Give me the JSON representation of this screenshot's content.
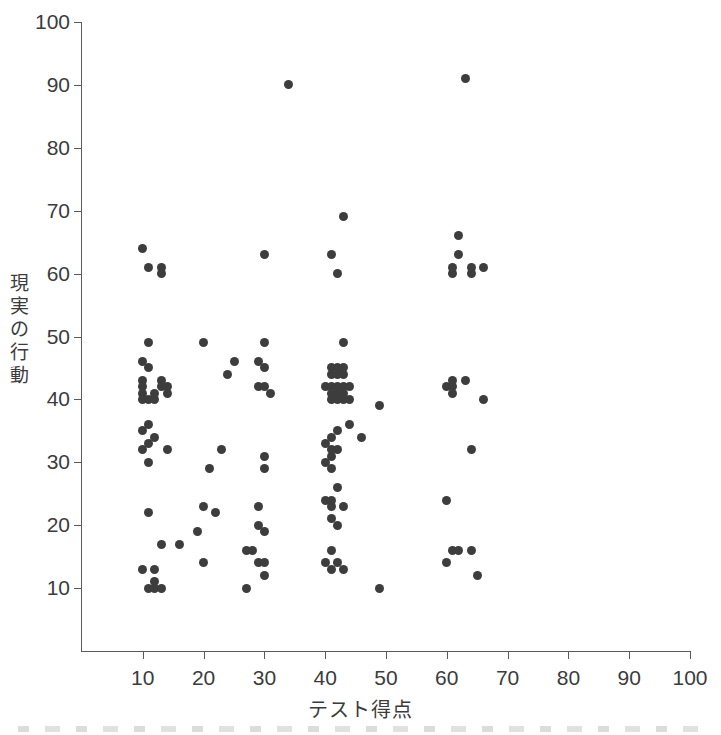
{
  "chart_data": {
    "type": "scatter",
    "title": "",
    "xlabel": "テスト得点",
    "ylabel": "現実の行動",
    "xlim": [
      0,
      100
    ],
    "ylim": [
      0,
      100
    ],
    "xticks": [
      10,
      20,
      30,
      40,
      50,
      60,
      70,
      80,
      90,
      100
    ],
    "yticks": [
      10,
      20,
      30,
      40,
      50,
      60,
      70,
      80,
      90,
      100
    ],
    "grid": false,
    "legend": null,
    "marker": {
      "shape": "circle",
      "color": "#3d3d3d",
      "size": 9
    },
    "points": [
      [
        34,
        90
      ],
      [
        63,
        91
      ],
      [
        43,
        69
      ],
      [
        10,
        64
      ],
      [
        62,
        66
      ],
      [
        11,
        61
      ],
      [
        13,
        61
      ],
      [
        13,
        60
      ],
      [
        30,
        63
      ],
      [
        41,
        63
      ],
      [
        62,
        63
      ],
      [
        42,
        60
      ],
      [
        61,
        60
      ],
      [
        61,
        61
      ],
      [
        64,
        61
      ],
      [
        66,
        61
      ],
      [
        64,
        60
      ],
      [
        11,
        49
      ],
      [
        20,
        49
      ],
      [
        30,
        49
      ],
      [
        43,
        49
      ],
      [
        10,
        46
      ],
      [
        25,
        46
      ],
      [
        29,
        46
      ],
      [
        11,
        45
      ],
      [
        24,
        44
      ],
      [
        30,
        45
      ],
      [
        41,
        45
      ],
      [
        42,
        45
      ],
      [
        43,
        45
      ],
      [
        10,
        43
      ],
      [
        13,
        43
      ],
      [
        41,
        44
      ],
      [
        42,
        44
      ],
      [
        43,
        44
      ],
      [
        61,
        43
      ],
      [
        63,
        43
      ],
      [
        10,
        42
      ],
      [
        13,
        42
      ],
      [
        14,
        42
      ],
      [
        29,
        42
      ],
      [
        30,
        42
      ],
      [
        40,
        42
      ],
      [
        41,
        42
      ],
      [
        42,
        42
      ],
      [
        43,
        42
      ],
      [
        44,
        42
      ],
      [
        60,
        42
      ],
      [
        61,
        42
      ],
      [
        10,
        41
      ],
      [
        12,
        41
      ],
      [
        14,
        41
      ],
      [
        31,
        41
      ],
      [
        41,
        41
      ],
      [
        42,
        41
      ],
      [
        43,
        41
      ],
      [
        61,
        41
      ],
      [
        66,
        40
      ],
      [
        10,
        40
      ],
      [
        11,
        40
      ],
      [
        12,
        40
      ],
      [
        41,
        40
      ],
      [
        42,
        40
      ],
      [
        43,
        40
      ],
      [
        44,
        40
      ],
      [
        49,
        39
      ],
      [
        11,
        36
      ],
      [
        44,
        36
      ],
      [
        10,
        35
      ],
      [
        42,
        35
      ],
      [
        12,
        34
      ],
      [
        41,
        34
      ],
      [
        46,
        34
      ],
      [
        11,
        33
      ],
      [
        40,
        33
      ],
      [
        10,
        32
      ],
      [
        14,
        32
      ],
      [
        23,
        32
      ],
      [
        41,
        32
      ],
      [
        42,
        32
      ],
      [
        64,
        32
      ],
      [
        11,
        30
      ],
      [
        30,
        31
      ],
      [
        41,
        31
      ],
      [
        40,
        30
      ],
      [
        21,
        29
      ],
      [
        30,
        29
      ],
      [
        41,
        29
      ],
      [
        42,
        26
      ],
      [
        40,
        24
      ],
      [
        41,
        24
      ],
      [
        60,
        24
      ],
      [
        11,
        22
      ],
      [
        20,
        23
      ],
      [
        29,
        23
      ],
      [
        41,
        23
      ],
      [
        43,
        23
      ],
      [
        22,
        22
      ],
      [
        41,
        21
      ],
      [
        29,
        20
      ],
      [
        42,
        20
      ],
      [
        19,
        19
      ],
      [
        30,
        19
      ],
      [
        13,
        17
      ],
      [
        16,
        17
      ],
      [
        61,
        16
      ],
      [
        62,
        16
      ],
      [
        64,
        16
      ],
      [
        27,
        16
      ],
      [
        28,
        16
      ],
      [
        41,
        16
      ],
      [
        60,
        14
      ],
      [
        20,
        14
      ],
      [
        29,
        14
      ],
      [
        30,
        14
      ],
      [
        40,
        14
      ],
      [
        42,
        14
      ],
      [
        10,
        13
      ],
      [
        12,
        13
      ],
      [
        41,
        13
      ],
      [
        43,
        13
      ],
      [
        65,
        12
      ],
      [
        30,
        12
      ],
      [
        11,
        10
      ],
      [
        12,
        10
      ],
      [
        13,
        10
      ],
      [
        12,
        11
      ],
      [
        27,
        10
      ],
      [
        49,
        10
      ]
    ]
  },
  "axes": {
    "x_tick_labels": [
      "10",
      "20",
      "30",
      "40",
      "50",
      "60",
      "70",
      "80",
      "90",
      "100"
    ],
    "y_tick_labels": [
      "10",
      "20",
      "30",
      "40",
      "50",
      "60",
      "70",
      "80",
      "90",
      "100"
    ]
  }
}
